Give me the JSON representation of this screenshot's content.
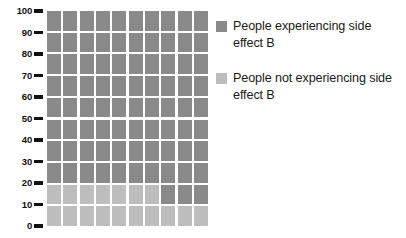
{
  "chart_data": {
    "type": "waffle",
    "title": "",
    "xlabel": "",
    "ylabel": "",
    "ylim": [
      0,
      100
    ],
    "grid": false,
    "legend_position": "right",
    "rows": 10,
    "columns": 10,
    "unit_per_cell": 1,
    "categories": [
      "People experiencing side effect B",
      "People not experiencing side effect B"
    ],
    "values": [
      83,
      17
    ],
    "series": [
      {
        "name": "People experiencing side effect B",
        "value": 83,
        "color": "#8a8a8a"
      },
      {
        "name": "People not experiencing side effect B",
        "value": 17,
        "color": "#bdbdbd"
      }
    ],
    "y_ticks": [
      100,
      90,
      80,
      70,
      60,
      50,
      40,
      30,
      20,
      10,
      0
    ],
    "cell_states": [
      [
        "on",
        "on",
        "on",
        "on",
        "on",
        "on",
        "on",
        "on",
        "on",
        "on"
      ],
      [
        "on",
        "on",
        "on",
        "on",
        "on",
        "on",
        "on",
        "on",
        "on",
        "on"
      ],
      [
        "on",
        "on",
        "on",
        "on",
        "on",
        "on",
        "on",
        "on",
        "on",
        "on"
      ],
      [
        "on",
        "on",
        "on",
        "on",
        "on",
        "on",
        "on",
        "on",
        "on",
        "on"
      ],
      [
        "on",
        "on",
        "on",
        "on",
        "on",
        "on",
        "on",
        "on",
        "on",
        "on"
      ],
      [
        "on",
        "on",
        "on",
        "on",
        "on",
        "on",
        "on",
        "on",
        "on",
        "on"
      ],
      [
        "on",
        "on",
        "on",
        "on",
        "on",
        "on",
        "on",
        "on",
        "on",
        "on"
      ],
      [
        "on",
        "on",
        "on",
        "on",
        "on",
        "on",
        "on",
        "on",
        "on",
        "on"
      ],
      [
        "off",
        "off",
        "off",
        "off",
        "off",
        "off",
        "off",
        "on",
        "on",
        "on"
      ],
      [
        "off",
        "off",
        "off",
        "off",
        "off",
        "off",
        "off",
        "off",
        "off",
        "off"
      ]
    ]
  },
  "axis": {
    "ticks": [
      {
        "label": "100"
      },
      {
        "label": "90"
      },
      {
        "label": "80"
      },
      {
        "label": "70"
      },
      {
        "label": "60"
      },
      {
        "label": "50"
      },
      {
        "label": "40"
      },
      {
        "label": "30"
      },
      {
        "label": "20"
      },
      {
        "label": "10"
      },
      {
        "label": "0"
      }
    ]
  },
  "legend": {
    "items": [
      {
        "label": "People experiencing side effect B",
        "color": "#8a8a8a",
        "swatch": "dark"
      },
      {
        "label": "People not experiencing side effect B",
        "color": "#bdbdbd",
        "swatch": "light"
      }
    ]
  }
}
